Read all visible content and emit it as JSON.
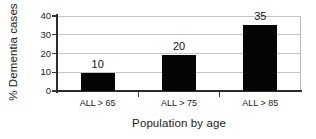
{
  "chart_data": {
    "type": "bar",
    "title": "",
    "categories": [
      "ALL > 65",
      "ALL > 75",
      "ALL > 85"
    ],
    "values": [
      10,
      20,
      35
    ],
    "value_labels": [
      "10",
      "20",
      "35"
    ],
    "xlabel": "Population by age",
    "ylabel": "% Dementia cases",
    "ylim": [
      0,
      40
    ],
    "yticks": [
      0,
      10,
      20,
      30,
      40
    ],
    "ytick_labels": [
      "0",
      "10",
      "20",
      "30",
      "40"
    ],
    "grid": true,
    "grid_axis": "y",
    "legend": false,
    "bar_color": "#050505",
    "axis_color": "#2b2b2b",
    "grid_color": "#c4c4c4",
    "background": "#ffffff",
    "bars": [
      {
        "category": "ALL > 65",
        "value": 10,
        "label": "10",
        "drawn_top_value": 9.7
      },
      {
        "category": "ALL > 75",
        "value": 20,
        "label": "20",
        "drawn_top_value": 19.4
      },
      {
        "category": "ALL > 85",
        "value": 35,
        "label": "35",
        "drawn_top_value": 35.0
      }
    ]
  }
}
